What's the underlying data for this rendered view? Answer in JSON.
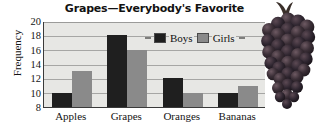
{
  "chart_data": {
    "type": "bar",
    "title": "Grapes—Everybody's Favorite",
    "xlabel": "",
    "ylabel": "Frequency",
    "categories": [
      "Apples",
      "Grapes",
      "Oranges",
      "Bananas"
    ],
    "series": [
      {
        "name": "Boys",
        "values": [
          10,
          18,
          12,
          10
        ],
        "color": "#1f1f1f"
      },
      {
        "name": "Girls",
        "values": [
          13,
          16,
          10,
          11
        ],
        "color": "#8a8a8a"
      }
    ],
    "ylim": [
      8,
      20
    ],
    "ytick_values": [
      8,
      10,
      12,
      14,
      16,
      18,
      20
    ],
    "ytick_labels": [
      "8",
      "10",
      "12",
      "14",
      "16",
      "18",
      "20"
    ],
    "grid": true,
    "grid_axis": "y",
    "legend_position": "top-right-inside",
    "plot_background": "#e7e7e4",
    "axis_color": "#3a3a3a"
  },
  "decoration": {
    "grape_cluster": "grape-cluster-photo"
  }
}
